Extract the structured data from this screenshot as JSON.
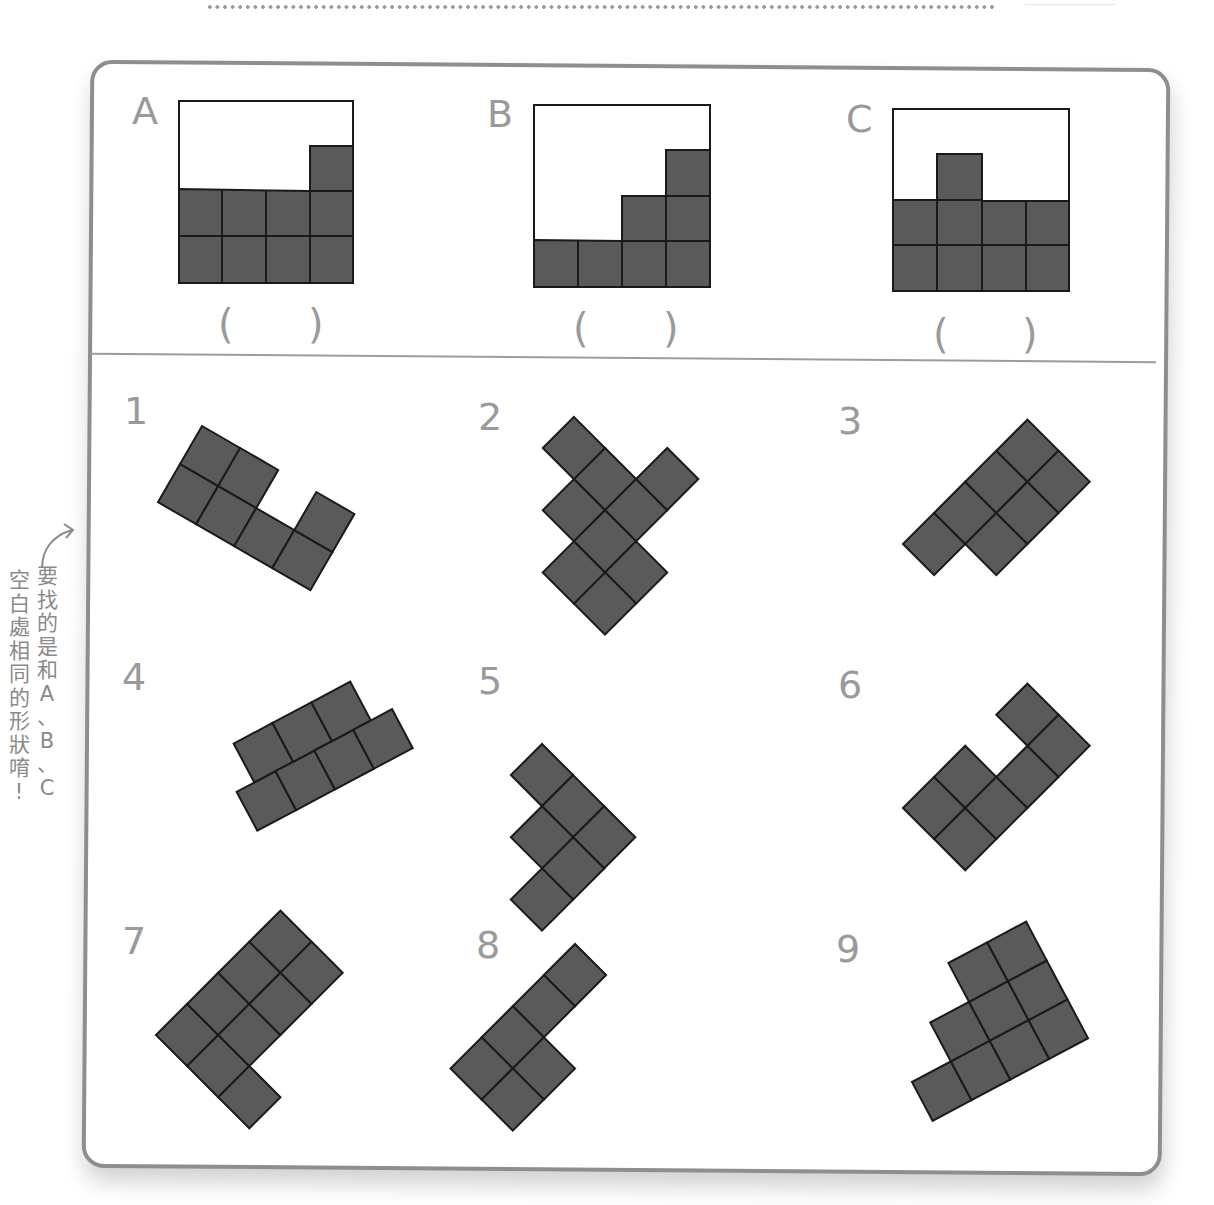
{
  "header": {
    "decoration": "dotted-line"
  },
  "side_note": {
    "line1": [
      "要",
      "找",
      "的",
      "是",
      "和",
      "A",
      "、",
      "B",
      "、",
      "C"
    ],
    "line2": [
      "空",
      "白",
      "處",
      "相",
      "同",
      "的",
      "形",
      "狀",
      "唷",
      "!"
    ],
    "full_text": "要找的是和A、B、C空白處相同的形狀唷!",
    "icon": "curved-arrow-icon"
  },
  "questions": [
    {
      "label": "A",
      "answer_open": "(",
      "answer_close": ")",
      "answer": ""
    },
    {
      "label": "B",
      "answer_open": "(",
      "answer_close": ")",
      "answer": ""
    },
    {
      "label": "C",
      "answer_open": "(",
      "answer_close": ")",
      "answer": ""
    }
  ],
  "options": [
    {
      "label": "1"
    },
    {
      "label": "2"
    },
    {
      "label": "3"
    },
    {
      "label": "4"
    },
    {
      "label": "5"
    },
    {
      "label": "6"
    },
    {
      "label": "7"
    },
    {
      "label": "8"
    },
    {
      "label": "9"
    }
  ],
  "colors": {
    "fill": "#5a5a5a",
    "stroke": "#1a1a1a",
    "label": "#9a9a9a",
    "frame": "#8e8e8e"
  }
}
